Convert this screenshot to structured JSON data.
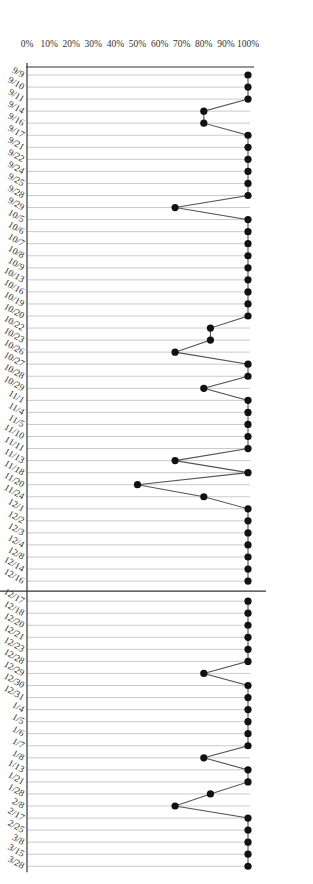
{
  "chart_data": {
    "type": "line",
    "title": "",
    "xlabel": "",
    "ylabel": "",
    "ylim": [
      0,
      100
    ],
    "yticks": [
      "0%",
      "10%",
      "20%",
      "30%",
      "40%",
      "50%",
      "60%",
      "70%",
      "80%",
      "90%",
      "100%"
    ],
    "orientation": "rotated 90 degrees clockwise",
    "grid": true,
    "phases": [
      {
        "name": "Baseline",
        "x": [
          "9/9",
          "9/10",
          "9/11",
          "9/14",
          "9/16",
          "9/17",
          "9/21",
          "9/22",
          "9/24",
          "9/25",
          "9/28",
          "9/29",
          "10/5",
          "10/6",
          "10/7",
          "10/8",
          "10/9",
          "10/13",
          "10/16",
          "10/19",
          "10/20",
          "10/22",
          "10/23",
          "10/26",
          "10/27",
          "10/28",
          "10/29",
          "11/1",
          "11/4",
          "11/5",
          "11/10",
          "11/11",
          "11/13",
          "11/18",
          "11/20",
          "11/24",
          "12/1",
          "12/2",
          "12/3",
          "12/4",
          "12/8",
          "12/14",
          "12/16"
        ],
        "values": [
          100,
          100,
          100,
          80,
          80,
          100,
          100,
          100,
          100,
          100,
          100,
          67,
          100,
          100,
          100,
          100,
          100,
          100,
          100,
          100,
          100,
          83,
          83,
          67,
          100,
          100,
          80,
          100,
          100,
          100,
          100,
          100,
          67,
          100,
          50,
          80,
          100,
          100,
          100,
          100,
          100,
          100,
          100
        ]
      },
      {
        "name": "Improvement contract",
        "x": [
          "12/17",
          "12/18",
          "12/20",
          "12/21",
          "12/23",
          "12/28",
          "12/29",
          "12/30",
          "12/31",
          "1/4",
          "1/5",
          "1/6",
          "1/7",
          "1/8",
          "1/13",
          "1/21",
          "1/28",
          "2/8",
          "2/17",
          "2/25",
          "3/8",
          "3/15",
          "3/28"
        ],
        "values": [
          100,
          100,
          100,
          100,
          100,
          100,
          80,
          100,
          100,
          100,
          100,
          100,
          100,
          80,
          100,
          100,
          83,
          67,
          100,
          100,
          100,
          100,
          100
        ]
      }
    ]
  }
}
